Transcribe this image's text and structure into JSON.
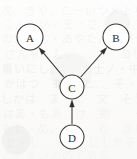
{
  "figure": {
    "kind": "directed-graph",
    "caption": "",
    "background_color": "#fbfbfa",
    "ink_color": "#3a3836",
    "node_fill": "#ffffff"
  },
  "graph": {
    "nodes": [
      {
        "id": "A",
        "label": "A",
        "cx": 30,
        "cy": 37,
        "r": 13
      },
      {
        "id": "B",
        "label": "B",
        "cx": 116,
        "cy": 37,
        "r": 13
      },
      {
        "id": "C",
        "label": "C",
        "cx": 72,
        "cy": 87,
        "r": 12
      },
      {
        "id": "D",
        "label": "D",
        "cx": 72,
        "cy": 137,
        "r": 12
      }
    ],
    "edges": [
      {
        "id": "C-A",
        "from": "C",
        "to": "A",
        "directed": true,
        "arrow_at": "A"
      },
      {
        "id": "C-B",
        "from": "C",
        "to": "B",
        "directed": true,
        "arrow_at": "B"
      },
      {
        "id": "D-C",
        "from": "D",
        "to": "C",
        "directed": true,
        "arrow_at": "C"
      }
    ]
  },
  "background_ghost_text": {
    "note": "faint scanner bleed-through from reverse page",
    "lines": [
      {
        "text": "次、きや、こーいつメ上ち、",
        "top": 2,
        "left": 1,
        "size": 11,
        "opacity": 0.5
      },
      {
        "text": "こん・い・を・さ・ん・ち",
        "top": 15,
        "left": 3,
        "size": 11,
        "opacity": 0.42
      },
      {
        "text": "のか・し・あやたん所がせ",
        "top": 30,
        "left": 2,
        "size": 11,
        "opacity": 0.45
      },
      {
        "text": "さんも・し、　　　　コリ",
        "top": 45,
        "left": 5,
        "size": 11,
        "opacity": 0.4
      },
      {
        "text": "番いにし。　　　土ノ・中",
        "top": 60,
        "left": 2,
        "size": 11,
        "opacity": 0.46
      },
      {
        "text": "かはつ　あ。・と、、そ・",
        "top": 75,
        "left": 4,
        "size": 11,
        "opacity": 0.4
      },
      {
        "text": "しかは　ま・た　文　そう",
        "top": 90,
        "left": 1,
        "size": 11,
        "opacity": 0.44
      },
      {
        "text": "はあ・もあ、け　動　　一",
        "top": 105,
        "left": 3,
        "size": 11,
        "opacity": 0.4
      },
      {
        "text": "もた・め、ん　　と　かし",
        "top": 120,
        "left": 2,
        "size": 11,
        "opacity": 0.42
      },
      {
        "text": "と・し　・・　にしかそ",
        "top": 134,
        "left": 5,
        "size": 11,
        "opacity": 0.38
      },
      {
        "text": "ことをいぶのである。　",
        "top": 147,
        "left": 2,
        "size": 11,
        "opacity": 0.36
      }
    ]
  }
}
